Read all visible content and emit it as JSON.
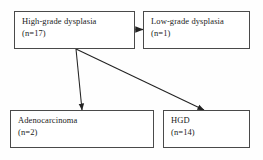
{
  "diagram": {
    "type": "flowchart",
    "title": "",
    "nodes": [
      {
        "id": "high-grade-dysplasia",
        "label": "High-grade dysplasia",
        "count": "(n=17)",
        "n": 17,
        "role": "source"
      },
      {
        "id": "low-grade-dysplasia",
        "label": "Low-grade dysplasia",
        "count": "(n=1)",
        "n": 1,
        "role": "outcome"
      },
      {
        "id": "adenocarcinoma",
        "label": "Adenocarcinoma",
        "count": "(n=2)",
        "n": 2,
        "role": "outcome"
      },
      {
        "id": "hgd-outcome",
        "label": "HGD",
        "count": "(n=14)",
        "n": 14,
        "role": "outcome"
      }
    ],
    "edges": [
      {
        "from": "high-grade-dysplasia",
        "to": "low-grade-dysplasia",
        "label": ""
      },
      {
        "from": "high-grade-dysplasia",
        "to": "adenocarcinoma",
        "label": ""
      },
      {
        "from": "high-grade-dysplasia",
        "to": "hgd-outcome",
        "label": ""
      }
    ],
    "colors": {
      "background": "#fefefe",
      "box_border": "#4a4a4a",
      "box_fill": "#ffffff",
      "text": "#1b1b1b",
      "connector": "#222222"
    }
  }
}
